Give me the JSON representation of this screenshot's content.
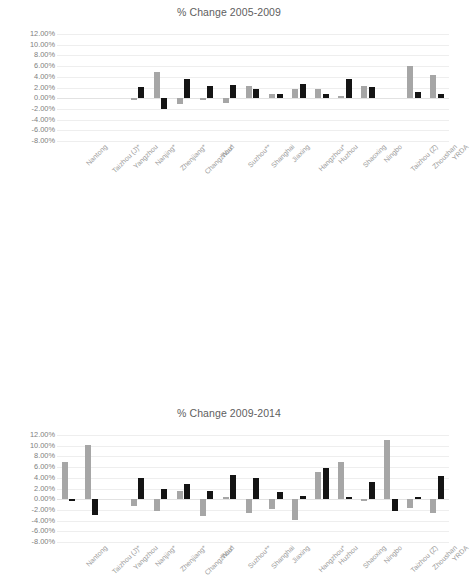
{
  "chart_data": [
    {
      "type": "bar",
      "title": "% Change 2005-2009",
      "xlabel": "",
      "ylabel": "",
      "ylim": [
        -0.08,
        0.12
      ],
      "ytick_labels": [
        "12.00%",
        "10.00%",
        "8.00%",
        "6.00%",
        "4.00%",
        "2.00%",
        "0.00%",
        "-2.00%",
        "-4.00%",
        "-6.00%",
        "-8.00%"
      ],
      "ytick_values": [
        12,
        10,
        8,
        6,
        4,
        2,
        0,
        -2,
        -4,
        -6,
        -8
      ],
      "grid": true,
      "legend": "none",
      "categories": [
        "Nantong",
        "Taizhou (J)*",
        "Yangzhou",
        "Nanjing*",
        "Zhenjiang*",
        "Changzhou*",
        "Wuxi",
        "Suzhou**",
        "Shanghai",
        "Jiaxing",
        "Hangzhou*",
        "Huzhou",
        "Shaoxing",
        "Ningbo",
        "Taizhou (Z)",
        "Zhoushan",
        "YRDA"
      ],
      "series": [
        {
          "name": "series-grey",
          "color": "#a6a6a6",
          "values": [
            0,
            0,
            0,
            -0.35,
            4.9,
            -1.1,
            -0.3,
            -0.85,
            2.2,
            0.8,
            1.75,
            1.75,
            0.45,
            2.35,
            0,
            6.0,
            4.4
          ]
        },
        {
          "name": "series-black",
          "color": "#141414",
          "values": [
            0,
            0,
            0,
            2.1,
            -2.0,
            3.5,
            2.2,
            2.55,
            1.7,
            0.8,
            2.7,
            0.8,
            3.55,
            2.05,
            0,
            1.1,
            0.8
          ]
        }
      ]
    },
    {
      "type": "bar",
      "title": "% Change 2009-2014",
      "xlabel": "",
      "ylabel": "",
      "ylim": [
        -0.08,
        0.12
      ],
      "ytick_labels": [
        "12.00%",
        "10.00%",
        "8.00%",
        "6.00%",
        "4.00%",
        "2.00%",
        "0.00%",
        "-2.00%",
        "-4.00%",
        "-6.00%",
        "-8.00%"
      ],
      "ytick_values": [
        12,
        10,
        8,
        6,
        4,
        2,
        0,
        -2,
        -4,
        -6,
        -8
      ],
      "grid": true,
      "legend": "none",
      "categories": [
        "Nantong",
        "Taizhou (J)*",
        "Yangzhou",
        "Nanjing*",
        "Zhenjiang*",
        "Changzhou*",
        "Wuxi",
        "Suzhou**",
        "Shanghai",
        "Jiaxing",
        "Hangzhou*",
        "Huzhou",
        "Shaoxing",
        "Ningbo",
        "Taizhou (Z)",
        "Zhoushan",
        "YRDA"
      ],
      "series": [
        {
          "name": "series-grey",
          "color": "#a6a6a6",
          "values": [
            7.0,
            10.1,
            0,
            -1.2,
            -2.3,
            1.5,
            -3.2,
            0.35,
            -2.5,
            -1.8,
            -3.8,
            5.0,
            7.0,
            -0.35,
            11.0,
            -1.6,
            -2.5
          ]
        },
        {
          "name": "series-black",
          "color": "#141414",
          "values": [
            -0.3,
            -3.0,
            0,
            4.0,
            1.9,
            2.9,
            1.6,
            4.6,
            3.9,
            1.35,
            0.6,
            5.9,
            0.35,
            3.2,
            -2.3,
            0.5,
            4.4
          ]
        }
      ]
    }
  ]
}
